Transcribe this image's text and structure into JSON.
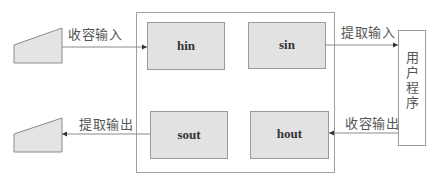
{
  "diagram": {
    "colors": {
      "line": "#8a8a8a",
      "buffer_fill": "#e2e2e2",
      "buffer_stroke": "#9a9a9a",
      "frame_stroke": "#a0a0a0",
      "device_fill": "#e4e4e4",
      "text": "#555555"
    },
    "buffers": {
      "hin": "hin",
      "sin": "sin",
      "sout": "sout",
      "hout": "hout"
    },
    "edges": {
      "input_collect": "收容输入",
      "input_extract": "提取输入",
      "output_collect": "收容输出",
      "output_extract": "提取输出"
    },
    "user_program": "用户程序",
    "devices": {
      "input_device": "input-device-trapezoid",
      "output_device": "output-device-trapezoid"
    }
  }
}
